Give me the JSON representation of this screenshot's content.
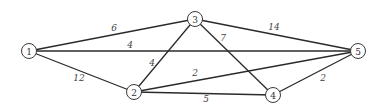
{
  "diagram": {
    "type": "weighted-undirected-graph",
    "colors": {
      "background": "#ffffff",
      "edge": "#2a2a2a",
      "node_stroke": "#3a3a3a",
      "text": "#333333"
    },
    "nodes": [
      {
        "id": "1",
        "label": "1",
        "x": 29,
        "y": 51
      },
      {
        "id": "2",
        "label": "2",
        "x": 134,
        "y": 92
      },
      {
        "id": "3",
        "label": "3",
        "x": 195,
        "y": 19
      },
      {
        "id": "4",
        "label": "4",
        "x": 273,
        "y": 95
      },
      {
        "id": "5",
        "label": "5",
        "x": 358,
        "y": 51
      }
    ],
    "edges": [
      {
        "from": "1",
        "to": "3",
        "weight": "6",
        "lx": 114,
        "ly": 28
      },
      {
        "from": "1",
        "to": "5",
        "weight": "4",
        "lx": 130,
        "ly": 45
      },
      {
        "from": "1",
        "to": "2",
        "weight": "12",
        "lx": 79,
        "ly": 78
      },
      {
        "from": "2",
        "to": "3",
        "weight": "4",
        "lx": 152,
        "ly": 63
      },
      {
        "from": "3",
        "to": "5",
        "weight": "14",
        "lx": 274,
        "ly": 27
      },
      {
        "from": "3",
        "to": "4",
        "weight": "7",
        "lx": 223,
        "ly": 38
      },
      {
        "from": "2",
        "to": "5",
        "weight": "2",
        "lx": 195,
        "ly": 73
      },
      {
        "from": "2",
        "to": "4",
        "weight": "5",
        "lx": 206,
        "ly": 99
      },
      {
        "from": "4",
        "to": "5",
        "weight": "2",
        "lx": 323,
        "ly": 78
      }
    ]
  }
}
